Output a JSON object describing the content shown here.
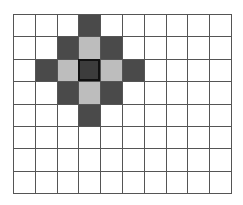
{
  "grid": {
    "rows": 8,
    "cols": 10,
    "colors": {
      "empty": "#ffffff",
      "dark": "#4a4a4a",
      "light": "#bdbdbd",
      "center": "#3c3c3c",
      "line": "#555555"
    },
    "cells": [
      [
        "empty",
        "empty",
        "empty",
        "dark",
        "empty",
        "empty",
        "empty",
        "empty",
        "empty",
        "empty"
      ],
      [
        "empty",
        "empty",
        "dark",
        "light",
        "dark",
        "empty",
        "empty",
        "empty",
        "empty",
        "empty"
      ],
      [
        "empty",
        "dark",
        "light",
        "center",
        "light",
        "dark",
        "empty",
        "empty",
        "empty",
        "empty"
      ],
      [
        "empty",
        "empty",
        "dark",
        "light",
        "dark",
        "empty",
        "empty",
        "empty",
        "empty",
        "empty"
      ],
      [
        "empty",
        "empty",
        "empty",
        "dark",
        "empty",
        "empty",
        "empty",
        "empty",
        "empty",
        "empty"
      ],
      [
        "empty",
        "empty",
        "empty",
        "empty",
        "empty",
        "empty",
        "empty",
        "empty",
        "empty",
        "empty"
      ],
      [
        "empty",
        "empty",
        "empty",
        "empty",
        "empty",
        "empty",
        "empty",
        "empty",
        "empty",
        "empty"
      ],
      [
        "empty",
        "empty",
        "empty",
        "empty",
        "empty",
        "empty",
        "empty",
        "empty",
        "empty",
        "empty"
      ]
    ]
  }
}
